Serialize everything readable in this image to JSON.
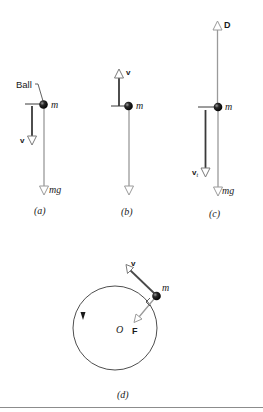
{
  "figure": {
    "colors": {
      "ink": "#1a1a1a",
      "force_gray": "#9a9a9a",
      "dark_vector": "#3a3a3a",
      "rule": "#8c8c8c"
    },
    "panels": {
      "a": {
        "caption": "(a)",
        "ball_label": "Ball",
        "mass_label": "m",
        "velocity_label": "v",
        "weight_label": "mg",
        "velocity_direction": "down"
      },
      "b": {
        "caption": "(b)",
        "mass_label": "m",
        "velocity_label": "v",
        "weight_label": "mg",
        "velocity_direction": "up"
      },
      "c": {
        "caption": "(c)",
        "mass_label": "m",
        "drag_label": "D",
        "terminal_velocity_label": "v",
        "terminal_velocity_subscript": "t",
        "weight_label": "mg"
      },
      "d": {
        "caption": "(d)",
        "mass_label": "m",
        "velocity_label": "v",
        "force_label": "F",
        "center_label": "O",
        "motion": "counterclockwise circular"
      }
    }
  }
}
